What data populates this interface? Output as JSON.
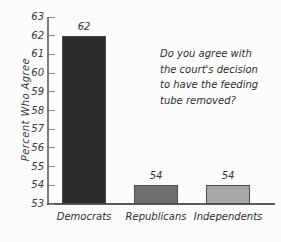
{
  "chart_data": {
    "type": "bar",
    "title": "",
    "subtitle": "",
    "xlabel": "",
    "ylabel": "Percent Who Agree",
    "categories": [
      "Democrats",
      "Republicans",
      "Independents"
    ],
    "values": [
      62,
      54,
      54
    ],
    "value_labels": [
      "62",
      "54",
      "54"
    ],
    "bar_colors": [
      "#2a2a2a",
      "#707070",
      "#a8a8a8"
    ],
    "ylim": [
      53,
      63
    ],
    "y_ticks": [
      63,
      62,
      61,
      60,
      59,
      58,
      57,
      56,
      55,
      54,
      53
    ],
    "y_tick_labels": [
      "63",
      "62",
      "61",
      "60",
      "59",
      "58",
      "57",
      "56",
      "55",
      "54",
      "53"
    ],
    "grid": false,
    "legend": false,
    "legend_position": "none",
    "annotations": [
      {
        "name": "survey-question",
        "lines": [
          "Do you agree with",
          "the court's decision",
          "to have the feeding",
          "tube removed?"
        ]
      }
    ],
    "style": {
      "background": "#fcfcfc",
      "axis_color": "#7d7d7d",
      "text_color": "#2e2e2e",
      "bar_edge_color": "#4a4a4a"
    }
  }
}
